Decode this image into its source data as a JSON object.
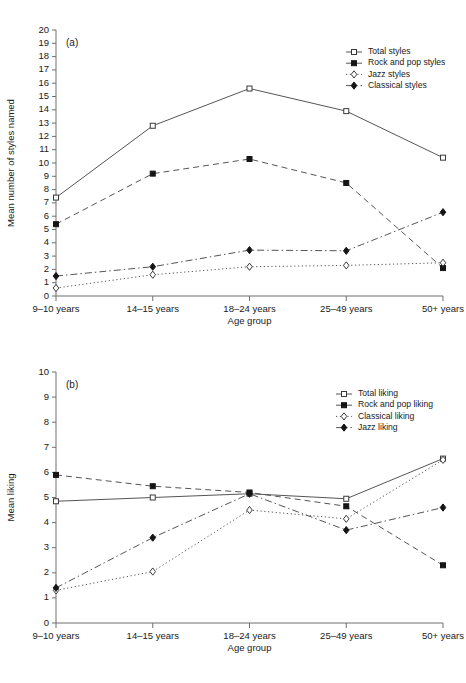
{
  "chart_data": [
    {
      "type": "line",
      "panel_tag": "(a)",
      "title": "",
      "xlabel": "Age group",
      "ylabel": "Mean number of styles named",
      "categories": [
        "9–10 years",
        "14–15 years",
        "18–24 years",
        "25–49 years",
        "50+ years"
      ],
      "ylim": [
        0,
        20
      ],
      "yticks": [
        0,
        1,
        2,
        3,
        4,
        5,
        6,
        7,
        8,
        9,
        10,
        11,
        12,
        13,
        14,
        15,
        16,
        17,
        18,
        19,
        20
      ],
      "grid": false,
      "legend_position": "top-right",
      "series": [
        {
          "name": "Total styles",
          "values": [
            7.4,
            12.8,
            15.6,
            13.9,
            10.4
          ],
          "line_style": "solid",
          "marker": "open-square"
        },
        {
          "name": "Rock and pop styles",
          "values": [
            5.4,
            9.2,
            10.3,
            8.5,
            2.1
          ],
          "line_style": "dashed",
          "marker": "filled-square"
        },
        {
          "name": "Jazz styles",
          "values": [
            0.6,
            1.6,
            2.2,
            2.3,
            2.5
          ],
          "line_style": "dotted",
          "marker": "open-diamond"
        },
        {
          "name": "Classical styles",
          "values": [
            1.5,
            2.2,
            3.45,
            3.4,
            6.3
          ],
          "line_style": "dashdot",
          "marker": "filled-diamond"
        }
      ]
    },
    {
      "type": "line",
      "panel_tag": "(b)",
      "title": "",
      "xlabel": "Age group",
      "ylabel": "Mean liking",
      "categories": [
        "9–10 years",
        "14–15 years",
        "18–24 years",
        "25–49 years",
        "50+ years"
      ],
      "ylim": [
        0,
        10
      ],
      "yticks": [
        0,
        1,
        2,
        3,
        4,
        5,
        6,
        7,
        8,
        9,
        10
      ],
      "grid": false,
      "legend_position": "top-right",
      "series": [
        {
          "name": "Total liking",
          "values": [
            4.85,
            5.0,
            5.15,
            4.95,
            6.55
          ],
          "line_style": "solid",
          "marker": "open-square"
        },
        {
          "name": "Rock and pop liking",
          "values": [
            5.9,
            5.45,
            5.2,
            4.65,
            2.3
          ],
          "line_style": "dashed",
          "marker": "filled-square"
        },
        {
          "name": "Classical liking",
          "values": [
            1.3,
            2.05,
            4.5,
            4.15,
            6.5
          ],
          "line_style": "dotted",
          "marker": "open-diamond"
        },
        {
          "name": "Jazz liking",
          "values": [
            1.4,
            3.4,
            5.15,
            3.7,
            4.6
          ],
          "line_style": "dashdot",
          "marker": "filled-diamond"
        }
      ]
    }
  ]
}
